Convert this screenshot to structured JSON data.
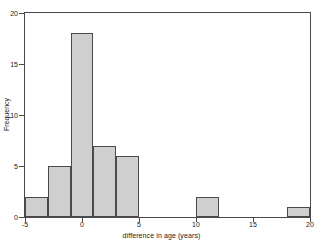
{
  "chart_data": {
    "type": "bar",
    "title": "",
    "xlabel": "difference in age (years)",
    "ylabel": "Frequency",
    "xlim": [
      -5,
      20
    ],
    "ylim": [
      0,
      20
    ],
    "xticks": [
      -5,
      0,
      5,
      10,
      15,
      20
    ],
    "xtick_labels": [
      "-5",
      "0",
      "5",
      "10",
      "15",
      "20"
    ],
    "yticks": [
      0,
      5,
      10,
      15,
      20
    ],
    "ytick_labels": [
      "0",
      "5",
      "10",
      "15",
      "20"
    ],
    "grid": false,
    "legend": false,
    "bin_width": 2,
    "bar_fill_color": "#cfcfcf",
    "bar_edge_color": "#4a4a4a",
    "axis_color": "#4a4a4a",
    "background_color": "#ffffff",
    "bins": [
      {
        "label": "-5 to -3",
        "x0": -5,
        "x1": -3,
        "value": 2
      },
      {
        "label": "-3 to -1",
        "x0": -3,
        "x1": -1,
        "value": 5
      },
      {
        "label": "-1 to 1",
        "x0": -1,
        "x1": 1,
        "value": 18
      },
      {
        "label": "1 to 3",
        "x0": 1,
        "x1": 3,
        "value": 7
      },
      {
        "label": "3 to 5",
        "x0": 3,
        "x1": 5,
        "value": 6
      },
      {
        "label": "10 to 12",
        "x0": 10,
        "x1": 12,
        "value": 2
      },
      {
        "label": "18 to 20",
        "x0": 18,
        "x1": 20,
        "value": 1
      }
    ],
    "categories": [
      "-5 to -3",
      "-3 to -1",
      "-1 to 1",
      "1 to 3",
      "3 to 5",
      "10 to 12",
      "18 to 20"
    ],
    "values": [
      2,
      5,
      18,
      7,
      6,
      2,
      1
    ]
  }
}
